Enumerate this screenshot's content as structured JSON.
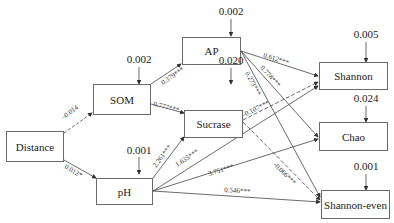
{
  "nodes": {
    "distance": "Distance",
    "som": "SOM",
    "ph": "pH",
    "ap": "AP",
    "sucrase": "Sucrase",
    "shannon": "Shannon",
    "chao": "Chao",
    "shannon_even": "Shannon-even"
  },
  "errors": {
    "som": "0.002",
    "ap": "0.002",
    "sucrase": "0.020",
    "ph": "0.001",
    "shannon": "0.005",
    "chao": "0.024",
    "shannon_even": "0.001"
  },
  "paths": [
    {
      "from": "Distance",
      "to": "SOM",
      "label": "-0.014",
      "style": "dashed"
    },
    {
      "from": "Distance",
      "to": "pH",
      "label": "0.012*",
      "style": "solid"
    },
    {
      "from": "SOM",
      "to": "AP",
      "label": "0.379***",
      "style": "solid"
    },
    {
      "from": "SOM",
      "to": "Sucrase",
      "label": "0.777***",
      "style": "solid"
    },
    {
      "from": "pH",
      "to": "Sucrase",
      "label": "2.261***",
      "style": "solid"
    },
    {
      "from": "pH",
      "to": "Shannon",
      "label": "1.635***",
      "style": "solid"
    },
    {
      "from": "pH",
      "to": "Chao",
      "label": "3.751***",
      "style": "solid"
    },
    {
      "from": "pH",
      "to": "Shannon-even",
      "label": "0.546***",
      "style": "solid"
    },
    {
      "from": "AP",
      "to": "Shannon",
      "label": "0.612***",
      "style": "solid"
    },
    {
      "from": "AP",
      "to": "Chao",
      "label": "0.778***",
      "style": "solid"
    },
    {
      "from": "AP",
      "to": "Shannon-even",
      "label": "0.273***",
      "style": "solid"
    },
    {
      "from": "Sucrase",
      "to": "Shannon",
      "label": "-0.107***",
      "style": "dashed"
    },
    {
      "from": "Sucrase",
      "to": "Shannon-even",
      "label": "-0.066***",
      "style": "dashed"
    }
  ]
}
